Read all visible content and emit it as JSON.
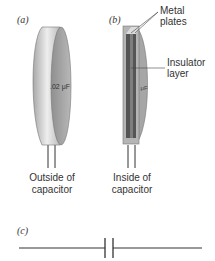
{
  "panels": {
    "a": {
      "label": "(a)",
      "value_label": ".02 μF",
      "caption_line1": "Outside of",
      "caption_line2": "capacitor"
    },
    "b": {
      "label": "(b)",
      "value_label": "μF",
      "caption_line1": "Inside of",
      "caption_line2": "capacitor",
      "callouts": {
        "metal_plates_line1": "Metal",
        "metal_plates_line2": "plates",
        "insulator_line1": "Insulator",
        "insulator_line2": "layer"
      }
    },
    "c": {
      "label": "(c)"
    }
  },
  "colors": {
    "body_light": "#d9d9d9",
    "body_mid": "#b3b3b3",
    "face": "#9e9e9e",
    "plate_dark": "#555555",
    "insulator": "#7a7a7a",
    "line": "#333333"
  }
}
